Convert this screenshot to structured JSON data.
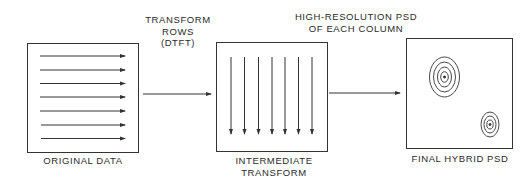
{
  "diagram": {
    "stages": [
      {
        "id": "original",
        "label": "ORIGINAL DATA",
        "content": "horizontal-row-arrows",
        "arrow_count": 7
      },
      {
        "id": "intermediate",
        "label": "INTERMEDIATE\nTRANSFORM",
        "content": "vertical-column-arrows",
        "arrow_count": 7
      },
      {
        "id": "final",
        "label": "FINAL HYBRID PSD",
        "content": "concentric-contour-peaks",
        "peak_count": 2
      }
    ],
    "transitions": [
      {
        "from": "original",
        "to": "intermediate",
        "label": "TRANSFORM\nROWS\n(DTFT)"
      },
      {
        "from": "intermediate",
        "to": "final",
        "label": "HIGH-RESOLUTION PSD\nOF EACH COLUMN"
      }
    ],
    "colors": {
      "line": "#333333",
      "background": "#ffffff",
      "text": "#2a2a2a"
    }
  }
}
